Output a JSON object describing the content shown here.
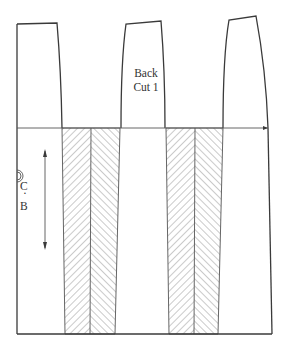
{
  "diagram": {
    "type": "pattern-piece",
    "labels": {
      "piece_name_line1": "Back",
      "piece_name_line2": "Cut 1",
      "centre_back_c": "C",
      "centre_back_dot": "·",
      "centre_back_b": "B"
    },
    "symbols": {
      "grainline": "double-arrow-icon",
      "centre_back_mark": "double-circle-icon",
      "extension_arrow": "arrow-right-icon"
    },
    "colors": {
      "line": "#3a3a3a",
      "hatch": "#666666",
      "background": "#ffffff"
    },
    "regions": [
      {
        "name": "left-panel",
        "hatched": false
      },
      {
        "name": "hatched-insert-1",
        "hatched": true,
        "pattern": "herringbone"
      },
      {
        "name": "middle-panel",
        "hatched": false
      },
      {
        "name": "hatched-insert-2",
        "hatched": true,
        "pattern": "herringbone"
      },
      {
        "name": "right-panel",
        "hatched": false
      }
    ]
  }
}
